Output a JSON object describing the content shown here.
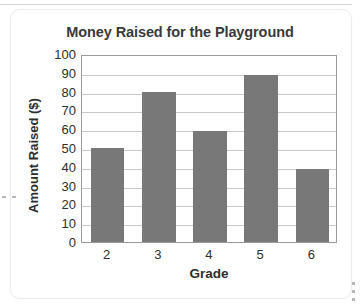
{
  "chart_data": {
    "type": "bar",
    "title": "Money Raised for the Playground",
    "xlabel": "Grade",
    "ylabel": "Amount Raised ($)",
    "categories": [
      "2",
      "3",
      "4",
      "5",
      "6"
    ],
    "values": [
      50,
      80,
      59,
      89,
      39
    ],
    "ylim": [
      0,
      100
    ],
    "ytick_step": 10,
    "yticks": [
      "100",
      "90",
      "80",
      "70",
      "60",
      "50",
      "40",
      "30",
      "20",
      "10",
      "0"
    ],
    "ytick_values": [
      100,
      90,
      80,
      70,
      60,
      50,
      40,
      30,
      20,
      10,
      0
    ],
    "grid": true,
    "legend": false,
    "bar_color": "#787878",
    "gridline_color": "#c8c8c8",
    "axis_color": "#9a9a9a",
    "text_color": "#2e2e2e",
    "title_color": "#3a3a3a",
    "background": "#ffffff"
  }
}
